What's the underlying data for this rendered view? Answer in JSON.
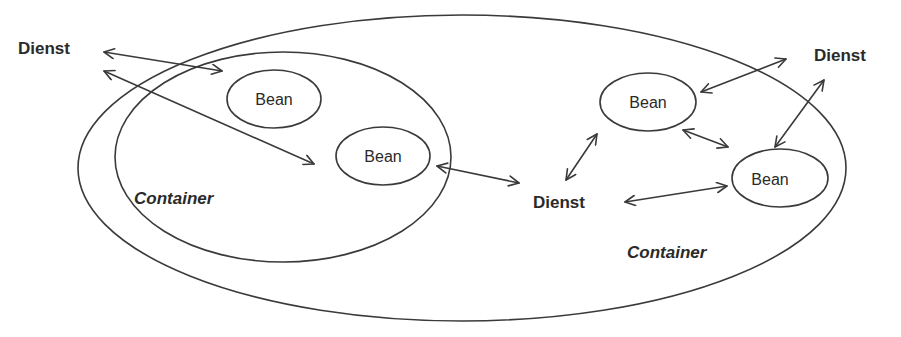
{
  "diagram": {
    "outer_container": {
      "label": "Container"
    },
    "inner_container": {
      "label": "Container"
    },
    "beans": [
      {
        "label": "Bean"
      },
      {
        "label": "Bean"
      },
      {
        "label": "Bean"
      },
      {
        "label": "Bean"
      }
    ],
    "services": [
      {
        "label": "Dienst"
      },
      {
        "label": "Dienst"
      },
      {
        "label": "Dienst"
      }
    ],
    "connections": [
      {
        "from": "services.0",
        "to": "inner_container",
        "type": "bidirectional"
      },
      {
        "from": "services.0",
        "to": "beans.1",
        "type": "bidirectional"
      },
      {
        "from": "beans.1",
        "to": "services.1",
        "type": "bidirectional"
      },
      {
        "from": "services.1",
        "to": "beans.2",
        "type": "bidirectional"
      },
      {
        "from": "services.1",
        "to": "beans.3",
        "type": "bidirectional"
      },
      {
        "from": "beans.2",
        "to": "beans.3",
        "type": "bidirectional"
      },
      {
        "from": "beans.2",
        "to": "services.2",
        "type": "bidirectional"
      },
      {
        "from": "beans.3",
        "to": "services.2",
        "type": "bidirectional"
      }
    ],
    "colors": {
      "line": "#3a3a3a",
      "text": "#2a2a2a",
      "background": "#ffffff"
    }
  }
}
